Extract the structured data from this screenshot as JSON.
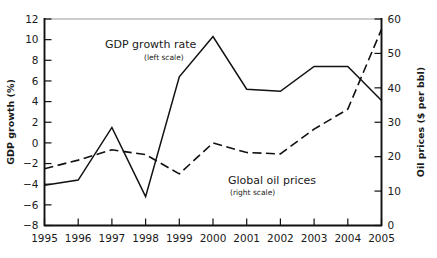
{
  "chart_data": {
    "type": "line",
    "title": "",
    "xlabel": "",
    "ylabel": "GDP growth (%)",
    "y2label": "Oil prices ($ per bbl)",
    "grid": false,
    "legend_position": "inline-annotations",
    "categories": [
      "1995",
      "1996",
      "1997",
      "1998",
      "1999",
      "2000",
      "2001",
      "2002",
      "2003",
      "2004",
      "2005"
    ],
    "x": [
      1995,
      1996,
      1997,
      1998,
      1999,
      2000,
      2001,
      2002,
      2003,
      2004,
      2005
    ],
    "ylim": [
      -8,
      12
    ],
    "yticks": [
      -8,
      -6,
      -4,
      -2,
      0,
      2,
      4,
      6,
      8,
      10,
      12
    ],
    "ytick_labels": [
      "−8",
      "−6",
      "−4",
      "−2",
      "0",
      "2",
      "4",
      "6",
      "8",
      "10",
      "12"
    ],
    "y2lim": [
      0,
      60
    ],
    "y2ticks": [
      0,
      10,
      20,
      30,
      40,
      50,
      60
    ],
    "y2tick_labels": [
      "0",
      "10",
      "20",
      "30",
      "40",
      "50",
      "60"
    ],
    "series": [
      {
        "name": "GDP growth rate",
        "axis": "left",
        "style": "solid",
        "annotation": "GDP growth rate",
        "annotation_sub": "(left scale)",
        "values": [
          -4.1,
          -3.6,
          1.5,
          -5.2,
          6.4,
          10.3,
          5.2,
          5.0,
          7.4,
          7.4,
          4.1
        ]
      },
      {
        "name": "Global oil prices",
        "axis": "right",
        "style": "dashed",
        "annotation": "Global oil prices",
        "annotation_sub": "(right scale)",
        "values": [
          16.5,
          19.0,
          22.0,
          20.6,
          15.0,
          24.0,
          21.2,
          20.8,
          28.0,
          33.8,
          57.0
        ]
      }
    ],
    "colors": {
      "line": "#111111",
      "axis": "#111111",
      "background": "#ffffff"
    }
  }
}
